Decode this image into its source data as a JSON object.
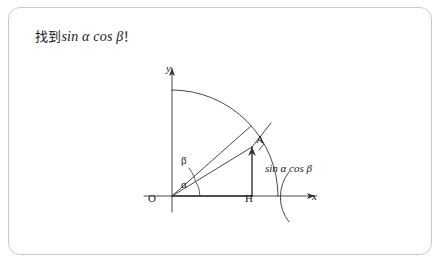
{
  "card": {
    "title_prefix": "找到",
    "title_math": "sin α cos β",
    "title_suffix": "！"
  },
  "figure": {
    "axis_y_label": "y",
    "axis_x_label": "x",
    "origin_label": "O",
    "foot_label": "H",
    "point_label": "A",
    "angle_alpha": "α",
    "angle_beta": "β",
    "segment_expression": "sin α cos β"
  },
  "colors": {
    "border": "#c9c9c9",
    "ink": "#1a1a1a",
    "line": "#333333"
  }
}
